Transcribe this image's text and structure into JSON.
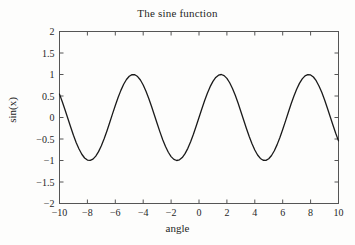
{
  "chart_data": {
    "type": "line",
    "title": "The sine function",
    "xlabel": "angle",
    "ylabel": "sin(x)",
    "xlim": [
      -10,
      10
    ],
    "ylim": [
      -2,
      2
    ],
    "grid": false,
    "legend": null,
    "line_color": "#1a1a1a",
    "line_width": 1.3,
    "background_color": "#fdfdfc",
    "axes_color": "#555555",
    "tick_direction": "in",
    "xticks": [
      -10,
      -8,
      -6,
      -4,
      -2,
      0,
      2,
      4,
      6,
      8,
      10
    ],
    "xtick_labels": [
      "-10",
      "-8",
      "-6",
      "-4",
      "-2",
      "0",
      "2",
      "4",
      "6",
      "8",
      "10"
    ],
    "yticks": [
      -2,
      -1.5,
      -1,
      -0.5,
      0,
      0.5,
      1,
      1.5,
      2
    ],
    "ytick_labels": [
      "-2",
      "-1.5",
      "-1",
      "-0.5",
      "0",
      "0.5",
      "1",
      "1.5",
      "2"
    ],
    "series": [
      {
        "name": "sin(x)",
        "function": "sin",
        "x": [
          -10,
          -9.8,
          -9.6,
          -9.4,
          -9.2,
          -9,
          -8.8,
          -8.6,
          -8.4,
          -8.2,
          -8,
          -7.8,
          -7.6,
          -7.4,
          -7.2,
          -7,
          -6.8,
          -6.6,
          -6.4,
          -6.2,
          -6,
          -5.8,
          -5.6,
          -5.4,
          -5.2,
          -5,
          -4.8,
          -4.6,
          -4.4,
          -4.2,
          -4,
          -3.8,
          -3.6,
          -3.4,
          -3.2,
          -3,
          -2.8,
          -2.6,
          -2.4,
          -2.2,
          -2,
          -1.8,
          -1.6,
          -1.4,
          -1.2,
          -1,
          -0.8,
          -0.6,
          -0.4,
          -0.2,
          0,
          0.2,
          0.4,
          0.6,
          0.8,
          1,
          1.2,
          1.4,
          1.6,
          1.8,
          2,
          2.2,
          2.4,
          2.6,
          2.8,
          3,
          3.2,
          3.4,
          3.6,
          3.8,
          4,
          4.2,
          4.4,
          4.6,
          4.8,
          5,
          5.2,
          5.4,
          5.6,
          5.8,
          6,
          6.2,
          6.4,
          6.6,
          6.8,
          7,
          7.2,
          7.4,
          7.6,
          7.8,
          8,
          8.2,
          8.4,
          8.6,
          8.8,
          9,
          9.2,
          9.4,
          9.6,
          9.8,
          10
        ],
        "y": [
          0.544,
          0.366,
          0.174,
          -0.024,
          -0.222,
          -0.412,
          -0.585,
          -0.734,
          -0.855,
          -0.942,
          -0.989,
          -0.999,
          -0.969,
          -0.898,
          -0.794,
          -0.657,
          -0.495,
          -0.312,
          -0.117,
          0.084,
          0.279,
          0.465,
          0.631,
          0.773,
          0.883,
          0.959,
          0.996,
          0.994,
          0.952,
          0.872,
          0.757,
          0.612,
          0.443,
          0.256,
          0.058,
          -0.141,
          -0.335,
          -0.516,
          -0.675,
          -0.808,
          -0.909,
          -0.974,
          -1.0,
          -0.985,
          -0.932,
          -0.841,
          -0.717,
          -0.565,
          -0.389,
          -0.199,
          0.0,
          0.199,
          0.389,
          0.565,
          0.717,
          0.841,
          0.932,
          0.985,
          1.0,
          0.974,
          0.909,
          0.808,
          0.675,
          0.516,
          0.335,
          0.141,
          -0.058,
          -0.256,
          -0.443,
          -0.612,
          -0.757,
          -0.872,
          -0.952,
          -0.994,
          -0.996,
          -0.959,
          -0.883,
          -0.773,
          -0.631,
          -0.465,
          -0.279,
          -0.084,
          0.117,
          0.312,
          0.495,
          0.657,
          0.794,
          0.898,
          0.969,
          0.999,
          0.989,
          0.942,
          0.855,
          0.734,
          0.585,
          0.412,
          0.222,
          0.024,
          -0.174,
          -0.366,
          -0.544
        ]
      }
    ]
  }
}
